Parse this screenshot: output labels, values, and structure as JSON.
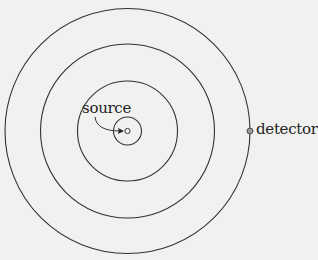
{
  "figure": {
    "type": "concentric-wavefronts",
    "center": {
      "x": 127.5,
      "y": 131
    },
    "wavefront_radii": [
      14,
      50,
      87,
      122.5
    ],
    "source_radius": 2.5,
    "detector": {
      "x": 250,
      "y": 131,
      "r": 3
    },
    "stroke_color": "#333333",
    "detector_fill": "#9a9a9a",
    "background": "#f1f1ef"
  },
  "labels": {
    "source": "source",
    "detector": "detector"
  }
}
